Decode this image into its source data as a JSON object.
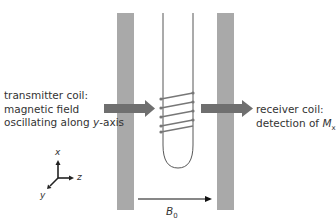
{
  "diagram": {
    "left_label": {
      "lines": [
        "transmitter coil:",
        "magnetic field",
        "oscillating along "
      ],
      "italic": "y",
      "suffix": "-axis"
    },
    "right_label": {
      "lines": [
        "receiver coil:",
        "detection of "
      ],
      "symbol": "M",
      "subscript": "x"
    },
    "field_label": {
      "symbol": "B",
      "subscript": "0"
    },
    "axes": {
      "x": "x",
      "y": "y",
      "z": "z"
    },
    "colors": {
      "magnet": "#a9a9a9",
      "arrow": "#6f6f6f",
      "coil": "#777777",
      "tube": "#444444",
      "text": "#333333"
    }
  }
}
